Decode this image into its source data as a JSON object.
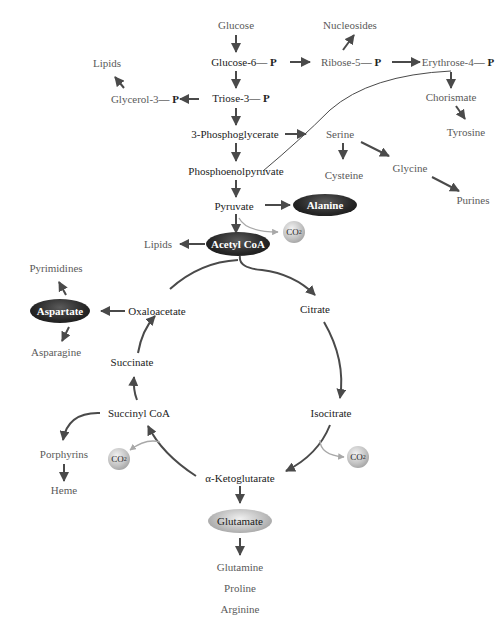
{
  "diagram": {
    "colors": {
      "arrow_dark": "#4a4a4a",
      "arrow_light": "#a8a8a8",
      "text_dark": "#222222",
      "text_gray": "#5a5a5a",
      "ellipse_dark": "#262626",
      "ellipse_light": "#bdbdbd"
    },
    "glycolysis": {
      "glucose": "Glucose",
      "glucose6p": "Glucose-6",
      "triose3p": "Triose-3",
      "phosphoglycerate": "3-Phosphoglycerate",
      "pep": "Phosphoenolpyruvate",
      "pyruvate": "Pyruvate",
      "phosphate": "— P"
    },
    "pentose": {
      "ribose5p": "Ribose-5",
      "erythrose4p": "Erythrose-4",
      "nucleosides": "Nucleosides",
      "chorismate": "Chorismate",
      "tyrosine": "Tyrosine"
    },
    "side": {
      "lipids_top": "Lipids",
      "glycerol3p": "Glycerol-3",
      "serine": "Serine",
      "cysteine": "Cysteine",
      "glycine": "Glycine",
      "purines": "Purines",
      "alanine": "Alanine",
      "lipids_mid": "Lipids",
      "acetyl_coa": "Acetyl CoA",
      "co2": "CO",
      "co2_sub": "2"
    },
    "tca": {
      "citrate": "Citrate",
      "isocitrate": "Isocitrate",
      "alpha_kg": "α-Ketoglutarate",
      "succinyl_coa": "Succinyl CoA",
      "succinate": "Succinate",
      "oxaloacetate": "Oxaloacetate"
    },
    "products": {
      "aspartate": "Aspartate",
      "pyrimidines": "Pyrimidines",
      "asparagine": "Asparagine",
      "porphyrins": "Porphyrins",
      "heme": "Heme",
      "glutamate": "Glutamate",
      "glutamine": "Glutamine",
      "proline": "Proline",
      "arginine": "Arginine"
    }
  }
}
